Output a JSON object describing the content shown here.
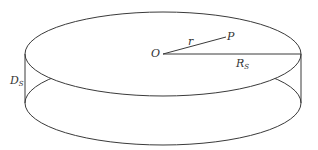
{
  "diagram": {
    "type": "cylinder-disk",
    "colors": {
      "stroke": "#3a3a3a",
      "background": "#ffffff",
      "text": "#333333"
    },
    "labels": {
      "center": "O",
      "point": "P",
      "radius_vector": "r",
      "radius": {
        "main": "R",
        "sub": "S"
      },
      "depth": {
        "main": "D",
        "sub": "S"
      }
    },
    "geometry": {
      "top_ellipse": {
        "cx": 163,
        "cy": 54,
        "rx": 138,
        "ry": 42
      },
      "bottom_ellipse": {
        "cx": 163,
        "cy": 103,
        "rx": 138,
        "ry": 42
      },
      "left_edge_x": 25,
      "right_edge_x": 301,
      "center": [
        163,
        54
      ],
      "point_P": [
        226,
        37
      ]
    }
  }
}
